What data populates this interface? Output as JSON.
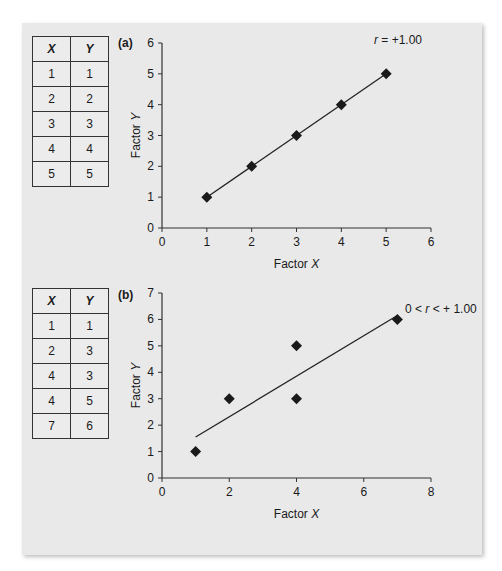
{
  "panels": [
    {
      "label": "(a)",
      "table": {
        "headers": [
          "X",
          "Y"
        ],
        "rows": [
          [
            "1",
            "1"
          ],
          [
            "2",
            "2"
          ],
          [
            "3",
            "3"
          ],
          [
            "4",
            "4"
          ],
          [
            "5",
            "5"
          ]
        ]
      },
      "annotation": "r = +1.00"
    },
    {
      "label": "(b)",
      "table": {
        "headers": [
          "X",
          "Y"
        ],
        "rows": [
          [
            "1",
            "1"
          ],
          [
            "2",
            "3"
          ],
          [
            "4",
            "3"
          ],
          [
            "4",
            "5"
          ],
          [
            "7",
            "6"
          ]
        ]
      },
      "annotation": "0 < r < + 1.00"
    }
  ],
  "chart_data": [
    {
      "type": "scatter",
      "title": "(a)",
      "xlabel": "Factor X",
      "ylabel": "Factor Y",
      "xlim": [
        0,
        6
      ],
      "ylim": [
        0,
        6
      ],
      "xticks": [
        0,
        1,
        2,
        3,
        4,
        5,
        6
      ],
      "yticks": [
        0,
        1,
        2,
        3,
        4,
        5,
        6
      ],
      "grid": false,
      "series": [
        {
          "name": "data",
          "x": [
            1,
            2,
            3,
            4,
            5
          ],
          "y": [
            1,
            2,
            3,
            4,
            5
          ],
          "marker": "diamond"
        }
      ],
      "trendline": {
        "x": [
          1,
          5
        ],
        "y": [
          1,
          5
        ]
      },
      "annotations": [
        "r = +1.00"
      ]
    },
    {
      "type": "scatter",
      "title": "(b)",
      "xlabel": "Factor X",
      "ylabel": "Factor Y",
      "xlim": [
        0,
        8
      ],
      "ylim": [
        0,
        7
      ],
      "xticks": [
        0,
        2,
        4,
        6,
        8
      ],
      "yticks": [
        0,
        1,
        2,
        3,
        4,
        5,
        6,
        7
      ],
      "grid": false,
      "series": [
        {
          "name": "data",
          "x": [
            1,
            2,
            4,
            4,
            7
          ],
          "y": [
            1,
            3,
            3,
            5,
            6
          ],
          "marker": "diamond"
        }
      ],
      "trendline": {
        "x": [
          1,
          7
        ],
        "y": [
          1.55,
          6.15
        ]
      },
      "annotations": [
        "0 < r < + 1.00"
      ]
    }
  ]
}
